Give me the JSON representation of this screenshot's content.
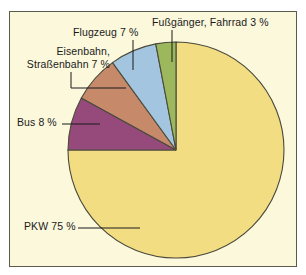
{
  "figure": {
    "background_color": "#ffffff",
    "panel_color": "#fbf8dc",
    "border_color": "#5c5c4e",
    "leader_color": "#1a1a1a",
    "slice_outline_color": "#4a4a3c"
  },
  "chart_data": {
    "type": "pie",
    "title": "",
    "subtitle": "",
    "xlabel": "",
    "ylabel": "",
    "grid": false,
    "legend_position": "none",
    "labels_inline": true,
    "start_angle_deg": 90,
    "direction": "counterclockwise",
    "units": "%",
    "categories": [
      "PKW",
      "Bus",
      "Eisenbahn, Straßenbahn",
      "Flugzeug",
      "Fußgänger, Fahrrad"
    ],
    "values": [
      75,
      8,
      7,
      7,
      3
    ],
    "colors": [
      "#f2dd82",
      "#954a7b",
      "#c68a6a",
      "#a4c5df",
      "#9cb75c"
    ],
    "slices": [
      {
        "name": "PKW",
        "value": 75,
        "label": "PKW 75 %",
        "color": "#f2dd82"
      },
      {
        "name": "Bus",
        "value": 8,
        "label": "Bus 8 %",
        "color": "#954a7b"
      },
      {
        "name": "Eisenbahn, Straßenbahn",
        "value": 7,
        "label_line1": "Eisenbahn,",
        "label_line2": "Straßenbahn 7 %",
        "color": "#c68a6a"
      },
      {
        "name": "Flugzeug",
        "value": 7,
        "label": "Flugzeug 7 %",
        "color": "#a4c5df"
      },
      {
        "name": "Fußgänger, Fahrrad",
        "value": 3,
        "label": "Fußgänger, Fahrrad 3 %",
        "color": "#9cb75c"
      }
    ]
  }
}
